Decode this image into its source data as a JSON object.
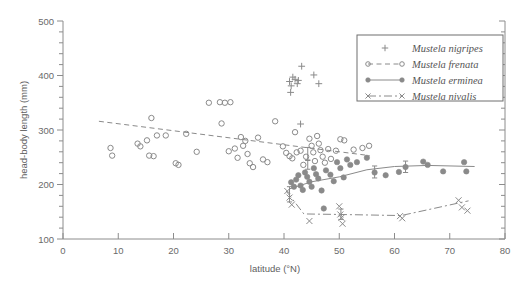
{
  "chart_data": {
    "type": "scatter",
    "title": "",
    "xlabel": "latitude (°N)",
    "ylabel": "head-body length (mm)",
    "xlim": [
      0,
      80
    ],
    "ylim": [
      100,
      500
    ],
    "xticks": [
      0,
      10,
      20,
      30,
      40,
      50,
      60,
      70,
      80
    ],
    "yticks": [
      100,
      200,
      300,
      400,
      500
    ],
    "x_minor_step": 5,
    "y_minor_step": 20,
    "grid": false,
    "legend_position": "top-right",
    "marker_color": "#8a8a8a",
    "line_color": "#8a8a8a",
    "series": [
      {
        "name": "Mustela nigripes",
        "marker": "plus",
        "line": "none",
        "points": [
          {
            "x": 41.0,
            "y": 389
          },
          {
            "x": 41.3,
            "y": 381
          },
          {
            "x": 41.6,
            "y": 397
          },
          {
            "x": 41.2,
            "y": 369
          },
          {
            "x": 42.0,
            "y": 393
          },
          {
            "x": 42.4,
            "y": 385
          },
          {
            "x": 42.6,
            "y": 391
          },
          {
            "x": 43.2,
            "y": 417
          },
          {
            "x": 45.4,
            "y": 401
          },
          {
            "x": 46.3,
            "y": 385
          },
          {
            "x": 43.0,
            "y": 311
          }
        ],
        "fit_line": []
      },
      {
        "name": "Mustela frenata",
        "marker": "open-circle",
        "line": "dashed",
        "points": [
          {
            "x": 8.6,
            "y": 267
          },
          {
            "x": 8.9,
            "y": 253
          },
          {
            "x": 13.5,
            "y": 275
          },
          {
            "x": 14.0,
            "y": 270
          },
          {
            "x": 15.2,
            "y": 281
          },
          {
            "x": 15.6,
            "y": 253
          },
          {
            "x": 16.0,
            "y": 322
          },
          {
            "x": 16.4,
            "y": 252
          },
          {
            "x": 17.0,
            "y": 290
          },
          {
            "x": 18.6,
            "y": 290
          },
          {
            "x": 20.4,
            "y": 239
          },
          {
            "x": 20.9,
            "y": 236
          },
          {
            "x": 22.3,
            "y": 293
          },
          {
            "x": 24.2,
            "y": 260
          },
          {
            "x": 26.4,
            "y": 350
          },
          {
            "x": 28.4,
            "y": 351
          },
          {
            "x": 29.3,
            "y": 350
          },
          {
            "x": 30.3,
            "y": 351
          },
          {
            "x": 28.7,
            "y": 312
          },
          {
            "x": 30.0,
            "y": 261
          },
          {
            "x": 31.1,
            "y": 266
          },
          {
            "x": 31.6,
            "y": 249
          },
          {
            "x": 32.2,
            "y": 287
          },
          {
            "x": 32.6,
            "y": 271
          },
          {
            "x": 33.0,
            "y": 280
          },
          {
            "x": 33.4,
            "y": 256
          },
          {
            "x": 33.8,
            "y": 239
          },
          {
            "x": 34.4,
            "y": 232
          },
          {
            "x": 35.3,
            "y": 286
          },
          {
            "x": 36.2,
            "y": 246
          },
          {
            "x": 37.0,
            "y": 241
          },
          {
            "x": 38.4,
            "y": 316
          },
          {
            "x": 39.8,
            "y": 270
          },
          {
            "x": 40.4,
            "y": 258
          },
          {
            "x": 41.0,
            "y": 252
          },
          {
            "x": 41.5,
            "y": 248
          },
          {
            "x": 42.0,
            "y": 296
          },
          {
            "x": 42.3,
            "y": 259
          },
          {
            "x": 43.0,
            "y": 262
          },
          {
            "x": 43.5,
            "y": 236
          },
          {
            "x": 44.0,
            "y": 251
          },
          {
            "x": 44.6,
            "y": 284
          },
          {
            "x": 45.0,
            "y": 271
          },
          {
            "x": 45.3,
            "y": 259
          },
          {
            "x": 45.6,
            "y": 243
          },
          {
            "x": 46.0,
            "y": 289
          },
          {
            "x": 46.3,
            "y": 275
          },
          {
            "x": 46.6,
            "y": 263
          },
          {
            "x": 47.0,
            "y": 251
          },
          {
            "x": 47.4,
            "y": 240
          },
          {
            "x": 48.0,
            "y": 265
          },
          {
            "x": 48.5,
            "y": 247
          },
          {
            "x": 49.4,
            "y": 262
          },
          {
            "x": 50.2,
            "y": 283
          },
          {
            "x": 50.9,
            "y": 281
          },
          {
            "x": 52.6,
            "y": 264
          },
          {
            "x": 54.2,
            "y": 267
          },
          {
            "x": 55.4,
            "y": 271
          }
        ],
        "fit_line": [
          {
            "x": 6.5,
            "y": 316
          },
          {
            "x": 55.5,
            "y": 253
          }
        ]
      },
      {
        "name": "Mustela erminea",
        "marker": "filled-circle",
        "line": "solid",
        "points": [
          {
            "x": 41.3,
            "y": 204
          },
          {
            "x": 41.8,
            "y": 196
          },
          {
            "x": 42.2,
            "y": 209
          },
          {
            "x": 42.6,
            "y": 217
          },
          {
            "x": 43.0,
            "y": 198
          },
          {
            "x": 43.4,
            "y": 190
          },
          {
            "x": 43.8,
            "y": 222
          },
          {
            "x": 44.2,
            "y": 214
          },
          {
            "x": 44.6,
            "y": 205
          },
          {
            "x": 45.0,
            "y": 196
          },
          {
            "x": 45.4,
            "y": 230
          },
          {
            "x": 45.8,
            "y": 219
          },
          {
            "x": 46.2,
            "y": 211
          },
          {
            "x": 46.8,
            "y": 189
          },
          {
            "x": 47.2,
            "y": 156
          },
          {
            "x": 47.6,
            "y": 226
          },
          {
            "x": 48.4,
            "y": 218
          },
          {
            "x": 49.0,
            "y": 206
          },
          {
            "x": 49.6,
            "y": 241
          },
          {
            "x": 50.2,
            "y": 230
          },
          {
            "x": 50.8,
            "y": 213
          },
          {
            "x": 51.4,
            "y": 246
          },
          {
            "x": 52.0,
            "y": 236
          },
          {
            "x": 53.2,
            "y": 241
          },
          {
            "x": 55.0,
            "y": 249
          },
          {
            "x": 56.4,
            "y": 222
          },
          {
            "x": 58.4,
            "y": 217
          },
          {
            "x": 60.8,
            "y": 223
          },
          {
            "x": 62.0,
            "y": 232
          },
          {
            "x": 65.2,
            "y": 242
          },
          {
            "x": 66.0,
            "y": 236
          },
          {
            "x": 68.8,
            "y": 224
          },
          {
            "x": 72.6,
            "y": 241
          },
          {
            "x": 73.0,
            "y": 224
          }
        ],
        "fit_line": [
          {
            "x": 41.0,
            "y": 192
          },
          {
            "x": 45.0,
            "y": 205
          },
          {
            "x": 50.0,
            "y": 214
          },
          {
            "x": 55.0,
            "y": 227
          },
          {
            "x": 60.0,
            "y": 233
          },
          {
            "x": 66.0,
            "y": 235
          },
          {
            "x": 74.5,
            "y": 233
          }
        ]
      },
      {
        "name": "Mustela nivalis",
        "marker": "cross",
        "line": "dash-dot",
        "points": [
          {
            "x": 40.6,
            "y": 188
          },
          {
            "x": 41.0,
            "y": 176
          },
          {
            "x": 41.4,
            "y": 163
          },
          {
            "x": 44.6,
            "y": 133
          },
          {
            "x": 50.0,
            "y": 160
          },
          {
            "x": 50.2,
            "y": 145
          },
          {
            "x": 50.4,
            "y": 139
          },
          {
            "x": 50.6,
            "y": 128
          },
          {
            "x": 61.0,
            "y": 142
          },
          {
            "x": 61.4,
            "y": 138
          },
          {
            "x": 71.6,
            "y": 171
          },
          {
            "x": 72.2,
            "y": 158
          },
          {
            "x": 73.2,
            "y": 152
          }
        ],
        "fit_line": [
          {
            "x": 40.4,
            "y": 188
          },
          {
            "x": 43.6,
            "y": 146
          },
          {
            "x": 50.0,
            "y": 145
          },
          {
            "x": 61.2,
            "y": 143
          },
          {
            "x": 73.4,
            "y": 170
          }
        ]
      }
    ],
    "error_bars": [
      {
        "x": 44.3,
        "y": 255,
        "low": 244,
        "high": 268
      },
      {
        "x": 44.3,
        "y": 236,
        "low": 228,
        "high": 245
      },
      {
        "x": 41.0,
        "y": 183,
        "low": 168,
        "high": 196
      },
      {
        "x": 56.4,
        "y": 222,
        "low": 212,
        "high": 234
      },
      {
        "x": 62.0,
        "y": 232,
        "low": 222,
        "high": 243
      },
      {
        "x": 50.3,
        "y": 144,
        "low": 136,
        "high": 155
      }
    ]
  },
  "legend": {
    "entries": [
      {
        "label": "Mustela nigripes"
      },
      {
        "label": "Mustela frenata"
      },
      {
        "label": "Mustela erminea"
      },
      {
        "label": "Mustela nivalis"
      }
    ]
  },
  "axes": {
    "x_tick_labels": [
      "0",
      "10",
      "20",
      "30",
      "40",
      "50",
      "60",
      "70",
      "80"
    ],
    "y_tick_labels": [
      "100",
      "200",
      "300",
      "400",
      "500"
    ],
    "xlabel": "latitude (°N)",
    "ylabel": "head-body length (mm)"
  }
}
